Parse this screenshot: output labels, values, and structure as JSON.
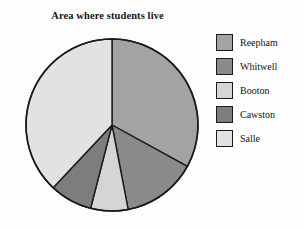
{
  "chart_data": {
    "type": "pie",
    "title": "Area where students live",
    "categories": [
      "Reepham",
      "Whitwell",
      "Booton",
      "Cawston",
      "Salle"
    ],
    "values": [
      33,
      14,
      7,
      8,
      38
    ],
    "units": "percent",
    "start_angle_deg": 0,
    "direction": "clockwise",
    "legend_position": "right",
    "grid": false,
    "colors": [
      "#a3a3a3",
      "#8a8a8a",
      "#d5d5d5",
      "#7d7d7d",
      "#e2e2e2"
    ],
    "slice_angles_deg": [
      118.8,
      50.4,
      25.2,
      28.8,
      136.8
    ],
    "outline_color": "#1a1a1a",
    "background": "#fdfdfd"
  },
  "legend": {
    "items": [
      {
        "label": "Reepham",
        "color": "#a3a3a3"
      },
      {
        "label": "Whitwell",
        "color": "#8a8a8a"
      },
      {
        "label": "Booton",
        "color": "#d5d5d5"
      },
      {
        "label": "Cawston",
        "color": "#7d7d7d"
      },
      {
        "label": "Salle",
        "color": "#e2e2e2"
      }
    ]
  }
}
